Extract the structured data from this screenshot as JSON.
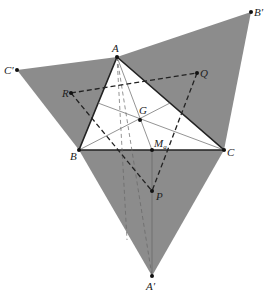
{
  "diagram": {
    "points": {
      "A": {
        "label": "A",
        "x": 117,
        "y": 57
      },
      "B": {
        "label": "B",
        "x": 79,
        "y": 150
      },
      "C": {
        "label": "C",
        "x": 224,
        "y": 150
      },
      "A_prime": {
        "label": "A′",
        "x": 152,
        "y": 276
      },
      "B_prime": {
        "label": "B′",
        "x": 251,
        "y": 12
      },
      "C_prime": {
        "label": "C′",
        "x": 17,
        "y": 70
      },
      "R": {
        "label": "R",
        "x": 71,
        "y": 93
      },
      "Q": {
        "label": "Q",
        "x": 197,
        "y": 73
      },
      "G": {
        "label": "G",
        "x": 140,
        "y": 120
      },
      "Ma": {
        "label": "M",
        "sub": "a",
        "x": 152,
        "y": 150
      },
      "P": {
        "label": "P",
        "x": 152,
        "y": 191
      }
    },
    "colors": {
      "shade": "#8c8c8c",
      "line": "#222222",
      "thin": "#666666"
    }
  }
}
